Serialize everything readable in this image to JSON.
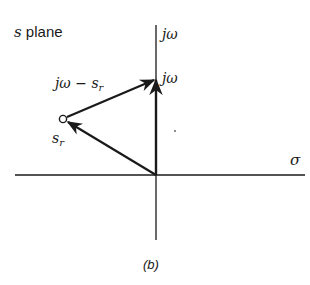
{
  "title": {
    "italic": "s",
    "rest": " plane"
  },
  "axes": {
    "imag_label": "jω",
    "real_label": "σ"
  },
  "points": {
    "jw_point_label": "jω",
    "pole": {
      "base": "s",
      "sub": "r"
    }
  },
  "vectors": {
    "difference": {
      "prefix": "jω − s",
      "sub": "r"
    }
  },
  "caption": "(b)",
  "colors": {
    "ink": "#1a1a1a",
    "background": "#ffffff"
  }
}
